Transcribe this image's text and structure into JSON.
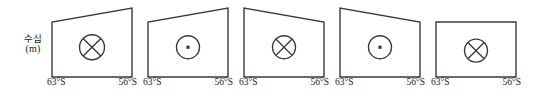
{
  "figure": {
    "background_color": "#ffffff",
    "line_color": "#3a3a3a",
    "text_color": "#1a1a1a",
    "y_axis_label": {
      "name": "수심",
      "unit": "(m)"
    },
    "x_tick_left": "63°S",
    "x_tick_right": "56°S",
    "symbol_names": {
      "into_page": "circle-cross-icon",
      "out_of_page": "circle-dot-icon"
    }
  },
  "chart_data": {
    "type": "diagram",
    "title": "",
    "xlabel": "",
    "ylabel": "수심 (m)",
    "x_tick_labels": [
      "63°S",
      "56°S"
    ],
    "panel_count": 5,
    "panels": [
      {
        "index": 1,
        "symbol": "⊗",
        "symbol_meaning": "into-page",
        "symbol_size": "large",
        "top_edge_slope": "up-to-right",
        "left_top_y": 22,
        "right_top_y": 8,
        "bottom_y": 77
      },
      {
        "index": 2,
        "symbol": "⊙",
        "symbol_meaning": "out-of-page",
        "symbol_size": "medium",
        "top_edge_slope": "up-to-right",
        "left_top_y": 22,
        "right_top_y": 8,
        "bottom_y": 77
      },
      {
        "index": 3,
        "symbol": "⊗",
        "symbol_meaning": "into-page",
        "symbol_size": "medium",
        "top_edge_slope": "down-to-right",
        "left_top_y": 8,
        "right_top_y": 22,
        "bottom_y": 77
      },
      {
        "index": 4,
        "symbol": "⊙",
        "symbol_meaning": "out-of-page",
        "symbol_size": "medium",
        "top_edge_slope": "down-to-right",
        "left_top_y": 8,
        "right_top_y": 22,
        "bottom_y": 77
      },
      {
        "index": 5,
        "symbol": "⊗",
        "symbol_meaning": "into-page",
        "symbol_size": "medium",
        "top_edge_slope": "flat",
        "left_top_y": 22,
        "right_top_y": 22,
        "bottom_y": 77
      }
    ]
  }
}
